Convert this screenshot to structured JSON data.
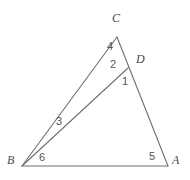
{
  "figure": {
    "background_color": "#ffffff",
    "line_color": "#6f6f6f",
    "label_color": "#4a4a4a",
    "width": 190,
    "height": 180,
    "vertices": [
      {
        "name": "C",
        "label": "C",
        "x": 117,
        "y": 37,
        "label_x": 112,
        "label_y": 18
      },
      {
        "name": "D",
        "label": "D",
        "x": 128,
        "y": 68,
        "label_x": 136,
        "label_y": 59
      },
      {
        "name": "A",
        "label": "A",
        "x": 168,
        "y": 166,
        "label_x": 172,
        "label_y": 160
      },
      {
        "name": "B",
        "label": "B",
        "x": 22,
        "y": 166,
        "label_x": 8,
        "label_y": 159
      }
    ],
    "segments": [
      {
        "name": "segment-bc",
        "from": "B",
        "to": "C"
      },
      {
        "name": "segment-ca",
        "from": "C",
        "to": "A"
      },
      {
        "name": "segment-ba",
        "from": "B",
        "to": "A"
      },
      {
        "name": "segment-bd",
        "from": "B",
        "to": "D"
      }
    ],
    "angles": [
      {
        "name": "angle-1",
        "label": "1",
        "x": 122,
        "y": 76,
        "at": "D"
      },
      {
        "name": "angle-2",
        "label": "2",
        "x": 111,
        "y": 60,
        "at": "D"
      },
      {
        "name": "angle-3",
        "label": "3",
        "x": 57,
        "y": 117,
        "at": "B"
      },
      {
        "name": "angle-4",
        "label": "4",
        "x": 108,
        "y": 42,
        "at": "C"
      },
      {
        "name": "angle-5",
        "label": "5",
        "x": 149,
        "y": 152,
        "at": "A"
      },
      {
        "name": "angle-6",
        "label": "6",
        "x": 39,
        "y": 153,
        "at": "B"
      }
    ]
  }
}
